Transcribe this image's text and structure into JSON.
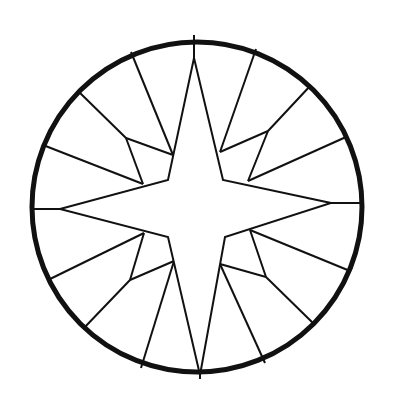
{
  "figure": {
    "subject": "compass-star-in-circle",
    "stroke_color": "#111111",
    "fill_color": "#ffffff",
    "background": "#ffffff",
    "circle": {
      "cx": 197,
      "cy": 207,
      "r": 165,
      "stroke_width": 5
    },
    "star_points": "194,58 223,180 331,203 225,237 200,375 168,237 60,209 168,180",
    "spokes": [
      "194,35 194,58",
      "331,203 362,203",
      "200,375 200,379",
      "60,209 32,209",
      "256,49 220,152",
      "311,85 268,131 248,181",
      "346,137 248,181",
      "220,152 268,131",
      "131,52 173,155",
      "78,91 126,138 173,155",
      "126,138 143,184",
      "43,145 143,184",
      "350,271 250,230",
      "315,325 266,277 250,230",
      "220,264 266,277",
      "220,264 265,363",
      "48,280 144,233",
      "83,329 130,280 174,261",
      "130,280 144,233",
      "141,368 174,261"
    ]
  }
}
